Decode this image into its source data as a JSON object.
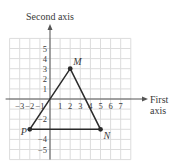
{
  "chart_data": {
    "type": "scatter",
    "title": "",
    "xlabel": "First axis",
    "ylabel": "Second axis",
    "xlabel_lines": [
      "First",
      "axis"
    ],
    "x_ticks": [
      -3,
      -2,
      -1,
      1,
      2,
      3,
      4,
      5,
      6,
      7
    ],
    "y_ticks": [
      5,
      4,
      3,
      2,
      1,
      -2,
      -4,
      -5
    ],
    "xlim": [
      -4,
      8
    ],
    "ylim": [
      -6,
      6
    ],
    "grid": true,
    "points": [
      {
        "label": "M",
        "x": 2,
        "y": 3
      },
      {
        "label": "N",
        "x": 5,
        "y": -3
      },
      {
        "label": "P",
        "x": -2,
        "y": -3
      }
    ],
    "polygon": [
      "M",
      "N",
      "P"
    ],
    "annotations": [
      "Triangle MNP"
    ]
  },
  "colors": {
    "grid": "#dcdcdc",
    "axis": "#555555",
    "shape": "#2b2b2b"
  }
}
